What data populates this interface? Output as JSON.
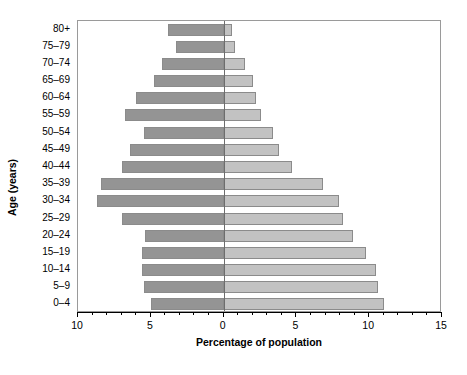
{
  "chart_data": {
    "type": "bar",
    "subtype": "population-pyramid",
    "title": "",
    "xlabel": "Percentage of population",
    "ylabel": "Age (years)",
    "categories": [
      "0–4",
      "5–9",
      "10–14",
      "15–19",
      "20–24",
      "25–29",
      "30–34",
      "35–39",
      "40–44",
      "45–49",
      "50–54",
      "55–59",
      "60–64",
      "65–69",
      "70–74",
      "75–79",
      "80+"
    ],
    "series": [
      {
        "name": "left",
        "color": "#949494",
        "values": [
          5.0,
          5.5,
          5.6,
          5.6,
          5.4,
          7.0,
          8.7,
          8.4,
          7.0,
          6.4,
          5.5,
          6.8,
          6.0,
          4.8,
          4.2,
          3.3,
          3.8
        ]
      },
      {
        "name": "right",
        "color": "#c2c2c2",
        "values": [
          11.0,
          10.6,
          10.5,
          9.8,
          8.9,
          8.2,
          7.9,
          6.8,
          4.7,
          3.8,
          3.4,
          2.6,
          2.2,
          2.0,
          1.5,
          0.8,
          0.6
        ]
      }
    ],
    "xlim": [
      -10,
      15
    ],
    "x_zero_value": 0,
    "xticks": [
      -10,
      -5,
      0,
      5,
      10,
      15
    ],
    "xtick_labels": [
      "10",
      "5",
      "0",
      "5",
      "10",
      "15"
    ],
    "x_minor_tick_step": 1,
    "grid": false,
    "legend": null
  }
}
